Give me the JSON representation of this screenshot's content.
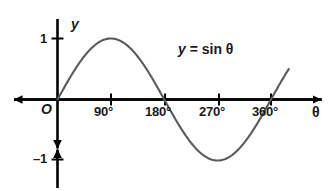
{
  "figure": {
    "background_color": "#ffffff",
    "axis_color": "#000000",
    "curve_color": "#5a5a5a",
    "text_color": "#1a1a1a"
  },
  "labels": {
    "y_axis_name": "y",
    "x_axis_name": "θ",
    "origin": "O",
    "y_tick_pos": "1",
    "y_tick_neg": "–1",
    "x_tick_90": "90°",
    "x_tick_180": "180°",
    "x_tick_270": "270°",
    "x_tick_360": "360°"
  },
  "equation": {
    "lhs": "y",
    "rhs": "= sin θ",
    "full": "y = sin θ"
  },
  "chart_data": {
    "type": "line",
    "title": "",
    "subtitle": "",
    "xlabel": "θ",
    "ylabel": "y",
    "annotations": [
      "y = sin θ"
    ],
    "legend": [],
    "legend_position": "none",
    "grid": false,
    "xlim": [
      -40,
      420
    ],
    "ylim": [
      -1.45,
      1.45
    ],
    "xticks": [
      90,
      180,
      270,
      360
    ],
    "xticklabels": [
      "90°",
      "180°",
      "270°",
      "360°"
    ],
    "yticks": [
      -1,
      1
    ],
    "yticklabels": [
      "–1",
      "1"
    ],
    "origin_label": "O",
    "series": [
      {
        "name": "y = sin θ",
        "color": "#5a5a5a",
        "x": [
          0,
          15,
          30,
          45,
          60,
          75,
          90,
          105,
          120,
          135,
          150,
          165,
          180,
          195,
          210,
          225,
          240,
          255,
          270,
          285,
          300,
          315,
          330,
          345,
          360,
          375,
          390
        ],
        "y": [
          0,
          0.259,
          0.5,
          0.707,
          0.866,
          0.966,
          1,
          0.966,
          0.866,
          0.707,
          0.5,
          0.259,
          0,
          -0.259,
          -0.5,
          -0.707,
          -0.866,
          -0.966,
          -1,
          -0.966,
          -0.866,
          -0.707,
          -0.5,
          -0.259,
          0,
          0.259,
          0.5
        ]
      }
    ],
    "key_points": {
      "maximum": {
        "x": 90,
        "y": 1
      },
      "minimum": {
        "x": 270,
        "y": -1
      },
      "zeros": [
        0,
        180,
        360
      ]
    }
  }
}
